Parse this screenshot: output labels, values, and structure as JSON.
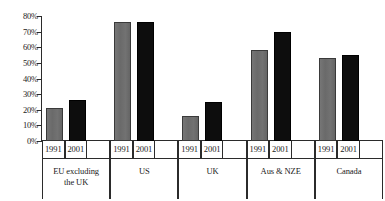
{
  "chart_data": {
    "type": "bar",
    "title": "",
    "subtitle": "",
    "xlabel": "",
    "ylabel": "",
    "ylim": [
      0,
      80
    ],
    "y_tick_labels": [
      "80%",
      "70%",
      "60%",
      "50%",
      "40%",
      "30%",
      "20%",
      "10%",
      "0%"
    ],
    "y_tick_values": [
      80,
      70,
      60,
      50,
      40,
      30,
      20,
      10,
      0
    ],
    "grid": false,
    "legend_position": "none",
    "categories": [
      "EU excluding the UK",
      "US",
      "UK",
      "Aus & NZE",
      "Canada"
    ],
    "category_lines": [
      [
        "EU excluding",
        "the UK"
      ],
      [
        "US"
      ],
      [
        "UK"
      ],
      [
        "Aus & NZE"
      ],
      [
        "Canada"
      ]
    ],
    "series": [
      {
        "name": "1991",
        "color": "#6e6e6e",
        "values": [
          21,
          76,
          16,
          58,
          53
        ]
      },
      {
        "name": "2001",
        "color": "#0d0d0d",
        "values": [
          26,
          76,
          25,
          70,
          55
        ]
      }
    ],
    "year_labels": [
      "1991",
      "2001"
    ]
  }
}
